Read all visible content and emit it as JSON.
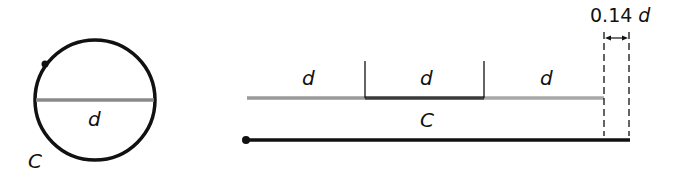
{
  "diagram": {
    "type": "circumference-vs-diameter",
    "circle": {
      "cx": 95,
      "cy": 100,
      "r": 60,
      "diameter_label": "d",
      "circumference_label": "C"
    },
    "segments": {
      "labels": [
        "d",
        "d",
        "d"
      ],
      "remainder_label_value": "0.14",
      "remainder_label_var": "d"
    },
    "unrolled": {
      "label": "C"
    },
    "colors": {
      "stroke": "#111111",
      "diameter": "#8a8a8a",
      "segment_dark": "#3a3a3a",
      "segment_light": "#9a9a9a"
    }
  }
}
